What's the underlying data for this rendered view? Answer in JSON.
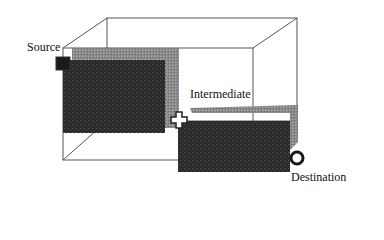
{
  "diagram": {
    "labels": {
      "source": "Source",
      "intermediate": "Intermediate",
      "destination": "Destination"
    },
    "colors": {
      "background": "#ffffff",
      "wireframe": "#555555",
      "block_front": "#2a2a2a",
      "block_side": "#8a8a8a",
      "marker_dark": "#1a1a1a"
    },
    "markers": {
      "source": "square-marker",
      "intermediate": "cross-marker",
      "destination": "ring-marker"
    }
  }
}
